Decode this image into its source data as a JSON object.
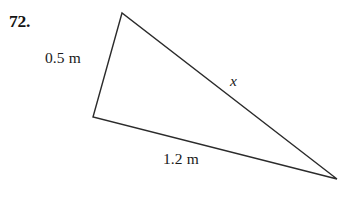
{
  "problem": {
    "number_label": "72.",
    "type": "triangle-diagram"
  },
  "figure": {
    "shape": "triangle",
    "stroke_color": "#2b2b2b",
    "stroke_width": 1.4,
    "fill": "none",
    "background_color": "#ffffff",
    "vertices": {
      "top": {
        "x": 122,
        "y": 13
      },
      "left": {
        "x": 93,
        "y": 117
      },
      "right": {
        "x": 337,
        "y": 179
      }
    },
    "sides": [
      {
        "name": "left-side",
        "from": "top",
        "to": "left",
        "label": "0.5 m",
        "label_x": 45,
        "label_y": 50
      },
      {
        "name": "bottom-side",
        "from": "left",
        "to": "right",
        "label": "1.2 m",
        "label_x": 163,
        "label_y": 151
      },
      {
        "name": "hypotenuse",
        "from": "top",
        "to": "right",
        "label": "x",
        "label_x": 230,
        "label_y": 73
      }
    ]
  },
  "labels": {
    "left_side_measure": "0.5 m",
    "bottom_side_measure": "1.2 m",
    "unknown_side": "x"
  }
}
